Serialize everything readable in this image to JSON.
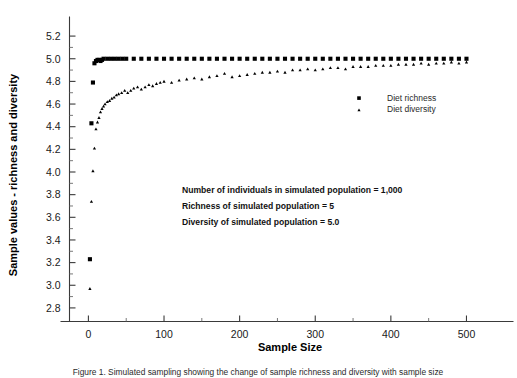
{
  "figure": {
    "background_color": "#ffffff",
    "ink_color": "#000000"
  },
  "chart_data": {
    "type": "scatter",
    "title": "",
    "xlabel": "Sample Size",
    "ylabel": "Sample values - richness and diversity",
    "xlim": [
      -25,
      545
    ],
    "ylim": [
      2.68,
      5.32
    ],
    "grid": false,
    "legend_position": "right-middle",
    "x_ticks": [
      0,
      100,
      200,
      300,
      400,
      500
    ],
    "x_tick_labels": [
      "0",
      "100",
      "200",
      "300",
      "400",
      "500"
    ],
    "x_minor_ticks": [
      50,
      150,
      250,
      350,
      450
    ],
    "y_ticks": [
      2.8,
      3.0,
      3.2,
      3.4,
      3.6,
      3.8,
      4.0,
      4.2,
      4.4,
      4.6,
      4.8,
      5.0,
      5.2
    ],
    "y_tick_labels": [
      "2.8",
      "3.0",
      "3.2",
      "3.4",
      "3.6",
      "3.8",
      "4.0",
      "4.2",
      "4.4",
      "4.6",
      "4.8",
      "5.0",
      "5.2"
    ],
    "series": [
      {
        "name": "Diet richness",
        "marker": "square",
        "marker_size": 4.1,
        "color": "#000000",
        "x": [
          2,
          4,
          6,
          8,
          10,
          12,
          14,
          16,
          18,
          20,
          25,
          30,
          35,
          40,
          45,
          50,
          60,
          70,
          80,
          90,
          100,
          110,
          120,
          130,
          140,
          150,
          160,
          170,
          180,
          190,
          200,
          210,
          220,
          230,
          240,
          250,
          260,
          270,
          280,
          290,
          300,
          310,
          320,
          330,
          340,
          350,
          360,
          370,
          380,
          390,
          400,
          410,
          420,
          430,
          440,
          450,
          460,
          470,
          480,
          490,
          500
        ],
        "y": [
          3.23,
          4.43,
          4.79,
          4.96,
          4.98,
          4.99,
          4.99,
          4.98,
          4.99,
          5.0,
          5.0,
          5.0,
          5.0,
          5.0,
          5.0,
          5.0,
          5.0,
          5.0,
          5.0,
          5.0,
          5.0,
          5.0,
          5.0,
          5.0,
          5.0,
          5.0,
          5.0,
          5.0,
          5.0,
          5.0,
          5.0,
          5.0,
          5.0,
          5.0,
          5.0,
          5.0,
          5.0,
          5.0,
          5.0,
          5.0,
          5.0,
          5.0,
          5.0,
          5.0,
          5.0,
          5.0,
          5.0,
          5.0,
          5.0,
          5.0,
          5.0,
          5.0,
          5.0,
          5.0,
          5.0,
          5.0,
          5.0,
          5.0,
          5.0,
          5.0,
          5.0
        ]
      },
      {
        "name": "Diet diversity",
        "marker": "triangle",
        "marker_size": 2.6,
        "color": "#000000",
        "x": [
          2,
          4,
          6,
          8,
          10,
          12,
          14,
          16,
          18,
          20,
          22,
          25,
          28,
          31,
          34,
          37,
          40,
          44,
          48,
          52,
          56,
          60,
          65,
          70,
          75,
          80,
          85,
          90,
          95,
          100,
          110,
          120,
          130,
          140,
          150,
          160,
          170,
          180,
          190,
          200,
          210,
          220,
          230,
          240,
          250,
          260,
          270,
          280,
          290,
          300,
          310,
          320,
          330,
          340,
          350,
          360,
          370,
          380,
          390,
          400,
          410,
          420,
          430,
          440,
          450,
          460,
          470,
          480,
          490,
          500
        ],
        "y": [
          2.97,
          3.74,
          4.01,
          4.21,
          4.38,
          4.44,
          4.48,
          4.53,
          4.56,
          4.58,
          4.6,
          4.62,
          4.63,
          4.65,
          4.66,
          4.68,
          4.69,
          4.7,
          4.72,
          4.7,
          4.72,
          4.74,
          4.75,
          4.73,
          4.75,
          4.77,
          4.76,
          4.78,
          4.79,
          4.8,
          4.79,
          4.81,
          4.82,
          4.83,
          4.82,
          4.84,
          4.85,
          4.87,
          4.84,
          4.85,
          4.86,
          4.87,
          4.88,
          4.88,
          4.89,
          4.88,
          4.9,
          4.9,
          4.91,
          4.9,
          4.91,
          4.92,
          4.92,
          4.91,
          4.93,
          4.93,
          4.93,
          4.94,
          4.94,
          4.94,
          4.95,
          4.95,
          4.95,
          4.96,
          4.95,
          4.96,
          4.96,
          4.97,
          4.96,
          4.97
        ]
      }
    ],
    "annotations": [
      "Number of individuals in simulated population = 1,000",
      "Richness of simulated population = 5",
      "Diversity of simulated population = 5.0"
    ]
  },
  "legend": {
    "entries": [
      {
        "label": "Diet richness",
        "marker": "square"
      },
      {
        "label": "Diet diversity",
        "marker": "triangle"
      }
    ]
  },
  "caption": {
    "text": "Figure 1. Simulated sampling showing the change of sample richness and diversity with sample size"
  }
}
